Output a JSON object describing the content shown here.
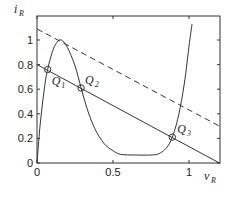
{
  "chart_data": {
    "type": "line",
    "title": "",
    "xlabel": "v_R",
    "ylabel": "i_R",
    "xlim": [
      0,
      1.2
    ],
    "ylim": [
      0,
      1.2
    ],
    "grid": false,
    "legend": null,
    "x_ticks": [
      0,
      0.5,
      1
    ],
    "x_tick_labels": [
      "0",
      "0.5",
      "1"
    ],
    "y_ticks": [
      0,
      0.2,
      0.4,
      0.6,
      0.8,
      1
    ],
    "y_tick_labels": [
      "0",
      "0.2",
      "0.4",
      "0.6",
      "0.8",
      "1"
    ],
    "series": [
      {
        "name": "device characteristic i_R(v_R)",
        "style": "solid",
        "points": [
          [
            0,
            0
          ],
          [
            0.02,
            0.3
          ],
          [
            0.05,
            0.62
          ],
          [
            0.07,
            0.76
          ],
          [
            0.1,
            0.9
          ],
          [
            0.13,
            0.98
          ],
          [
            0.16,
            1.0
          ],
          [
            0.2,
            0.94
          ],
          [
            0.25,
            0.79
          ],
          [
            0.29,
            0.61
          ],
          [
            0.33,
            0.44
          ],
          [
            0.38,
            0.28
          ],
          [
            0.44,
            0.16
          ],
          [
            0.5,
            0.1
          ],
          [
            0.55,
            0.07
          ],
          [
            0.65,
            0.065
          ],
          [
            0.75,
            0.065
          ],
          [
            0.8,
            0.075
          ],
          [
            0.85,
            0.12
          ],
          [
            0.89,
            0.21
          ],
          [
            0.93,
            0.38
          ],
          [
            0.97,
            0.65
          ],
          [
            1.0,
            0.95
          ],
          [
            1.02,
            1.13
          ]
        ]
      },
      {
        "name": "load line",
        "style": "solid",
        "points": [
          [
            0,
            0.8
          ],
          [
            1.2,
            0
          ]
        ]
      },
      {
        "name": "shifted load line",
        "style": "dashed",
        "points": [
          [
            0,
            1.09
          ],
          [
            1.2,
            0.3
          ]
        ]
      }
    ],
    "annotations": [
      {
        "label": "Q",
        "sub": "1",
        "x": 0.07,
        "y": 0.76
      },
      {
        "label": "Q",
        "sub": "2",
        "x": 0.29,
        "y": 0.61
      },
      {
        "label": "Q",
        "sub": "3",
        "x": 0.89,
        "y": 0.21
      }
    ]
  },
  "axes": {
    "x_label_main": "v",
    "x_label_sub": "R",
    "y_label_main": "i",
    "y_label_sub": "R"
  }
}
